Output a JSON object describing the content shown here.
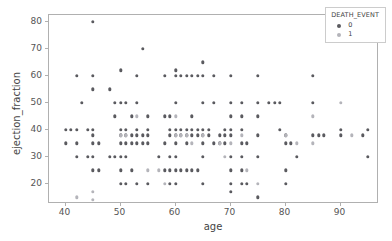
{
  "chart_data": {
    "type": "scatter",
    "title": "",
    "xlabel": "age",
    "ylabel": "ejection_fraction",
    "xlim": [
      37,
      97
    ],
    "ylim": [
      12.5,
      82.5
    ],
    "xticks": [
      40,
      50,
      60,
      70,
      80,
      90
    ],
    "yticks": [
      20,
      30,
      40,
      50,
      60,
      70,
      80
    ],
    "grid": false,
    "legend": {
      "title": "DEATH_EVENT",
      "position": "upper right",
      "entries": [
        {
          "label": "0",
          "color": "#5a5a5f"
        },
        {
          "label": "1",
          "color": "#b4b4ba"
        }
      ]
    },
    "series": [
      {
        "name": "0",
        "color": "#5a5a5f",
        "points": [
          [
            40,
            35
          ],
          [
            40,
            40
          ],
          [
            41,
            40
          ],
          [
            42,
            40
          ],
          [
            42,
            60
          ],
          [
            42,
            35
          ],
          [
            42,
            30
          ],
          [
            43,
            50
          ],
          [
            44,
            40
          ],
          [
            44,
            30
          ],
          [
            45,
            80
          ],
          [
            45,
            60
          ],
          [
            45,
            55
          ],
          [
            45,
            38
          ],
          [
            45,
            35
          ],
          [
            45,
            40
          ],
          [
            45,
            25
          ],
          [
            45,
            30
          ],
          [
            46,
            35
          ],
          [
            46,
            25
          ],
          [
            48,
            55
          ],
          [
            48,
            30
          ],
          [
            49,
            45
          ],
          [
            49,
            30
          ],
          [
            49,
            50
          ],
          [
            50,
            62
          ],
          [
            50,
            50
          ],
          [
            50,
            40
          ],
          [
            50,
            38
          ],
          [
            50,
            35
          ],
          [
            50,
            30
          ],
          [
            50,
            25
          ],
          [
            50,
            20
          ],
          [
            51,
            50
          ],
          [
            51,
            40
          ],
          [
            51,
            38
          ],
          [
            51,
            35
          ],
          [
            51,
            30
          ],
          [
            51,
            20
          ],
          [
            52,
            45
          ],
          [
            52,
            38
          ],
          [
            52,
            35
          ],
          [
            52,
            25
          ],
          [
            53,
            60
          ],
          [
            53,
            50
          ],
          [
            53,
            40
          ],
          [
            53,
            38
          ],
          [
            53,
            35
          ],
          [
            53,
            20
          ],
          [
            54,
            70
          ],
          [
            54,
            38
          ],
          [
            54,
            35
          ],
          [
            55,
            45
          ],
          [
            55,
            40
          ],
          [
            55,
            38
          ],
          [
            55,
            35
          ],
          [
            55,
            20
          ],
          [
            57,
            30
          ],
          [
            58,
            60
          ],
          [
            58,
            35
          ],
          [
            58,
            25
          ],
          [
            58,
            45
          ],
          [
            59,
            45
          ],
          [
            59,
            40
          ],
          [
            59,
            38
          ],
          [
            59,
            25
          ],
          [
            59,
            30
          ],
          [
            59,
            20
          ],
          [
            60,
            62
          ],
          [
            60,
            60
          ],
          [
            60,
            50
          ],
          [
            60,
            40
          ],
          [
            60,
            38
          ],
          [
            60,
            35
          ],
          [
            60,
            30
          ],
          [
            60,
            25
          ],
          [
            60,
            20
          ],
          [
            61,
            60
          ],
          [
            61,
            38
          ],
          [
            61,
            40
          ],
          [
            61,
            25
          ],
          [
            62,
            60
          ],
          [
            62,
            40
          ],
          [
            62,
            38
          ],
          [
            62,
            35
          ],
          [
            62,
            25
          ],
          [
            63,
            60
          ],
          [
            63,
            45
          ],
          [
            63,
            40
          ],
          [
            63,
            38
          ],
          [
            63,
            25
          ],
          [
            64,
            60
          ],
          [
            64,
            38
          ],
          [
            64,
            40
          ],
          [
            64,
            25
          ],
          [
            65,
            65
          ],
          [
            65,
            50
          ],
          [
            65,
            40
          ],
          [
            65,
            38
          ],
          [
            65,
            35
          ],
          [
            65,
            30
          ],
          [
            65,
            20
          ],
          [
            65,
            60
          ],
          [
            66,
            40
          ],
          [
            66,
            38
          ],
          [
            67,
            60
          ],
          [
            67,
            50
          ],
          [
            67,
            35
          ],
          [
            68,
            38
          ],
          [
            68,
            35
          ],
          [
            69,
            40
          ],
          [
            69,
            38
          ],
          [
            69,
            35
          ],
          [
            70,
            60
          ],
          [
            70,
            50
          ],
          [
            70,
            45
          ],
          [
            70,
            40
          ],
          [
            70,
            38
          ],
          [
            70,
            30
          ],
          [
            70,
            25
          ],
          [
            70,
            20
          ],
          [
            70,
            17
          ],
          [
            72,
            50
          ],
          [
            72,
            45
          ],
          [
            72,
            40
          ],
          [
            72,
            35
          ],
          [
            72,
            30
          ],
          [
            72,
            25
          ],
          [
            72,
            20
          ],
          [
            73,
            35
          ],
          [
            73,
            20
          ],
          [
            75,
            60
          ],
          [
            75,
            50
          ],
          [
            75,
            45
          ],
          [
            75,
            38
          ],
          [
            75,
            30
          ],
          [
            75,
            15
          ],
          [
            77,
            50
          ],
          [
            78,
            50
          ],
          [
            79,
            50
          ],
          [
            79,
            40
          ],
          [
            80,
            38
          ],
          [
            80,
            35
          ],
          [
            80,
            25
          ],
          [
            80,
            20
          ],
          [
            81,
            35
          ],
          [
            82,
            30
          ],
          [
            85,
            60
          ],
          [
            85,
            50
          ],
          [
            85,
            38
          ],
          [
            86,
            38
          ],
          [
            87,
            38
          ],
          [
            90,
            40
          ],
          [
            90,
            38
          ],
          [
            94,
            38
          ],
          [
            95,
            40
          ],
          [
            95,
            30
          ]
        ]
      },
      {
        "name": "1",
        "color": "#b4b4ba",
        "points": [
          [
            42,
            15
          ],
          [
            45,
            17
          ],
          [
            45,
            14
          ],
          [
            50,
            38
          ],
          [
            51,
            38
          ],
          [
            53,
            45
          ],
          [
            55,
            25
          ],
          [
            57,
            25
          ],
          [
            58,
            20
          ],
          [
            60,
            38
          ],
          [
            60,
            45
          ],
          [
            61,
            38
          ],
          [
            62,
            38
          ],
          [
            63,
            35
          ],
          [
            65,
            38
          ],
          [
            68,
            35
          ],
          [
            69,
            30
          ],
          [
            70,
            35
          ],
          [
            72,
            38
          ],
          [
            73,
            25
          ],
          [
            75,
            20
          ],
          [
            80,
            38
          ],
          [
            82,
            35
          ],
          [
            85,
            45
          ],
          [
            85,
            35
          ],
          [
            90,
            50
          ],
          [
            92,
            38
          ]
        ]
      }
    ]
  },
  "axis": {
    "xlabel": "age",
    "ylabel": "ejection_fraction"
  }
}
